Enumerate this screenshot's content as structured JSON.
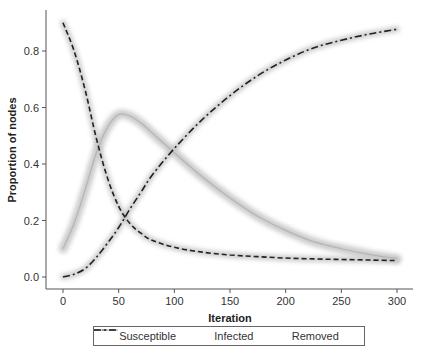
{
  "chart_data": {
    "type": "line",
    "title": "",
    "xlabel": "Iteration",
    "ylabel": "Proportion of nodes",
    "xlim": [
      0,
      300
    ],
    "ylim": [
      0,
      0.9
    ],
    "xticks": [
      0,
      50,
      100,
      150,
      200,
      250,
      300
    ],
    "xtick_labels": [
      "0",
      "50",
      "100",
      "150",
      "200",
      "250",
      "300"
    ],
    "yticks": [
      0.0,
      0.2,
      0.4,
      0.6,
      0.8
    ],
    "ytick_labels": [
      "0.0",
      "0.2",
      "0.4",
      "0.6",
      "0.8"
    ],
    "grid": false,
    "legend_position": "bottom",
    "x": [
      0,
      10,
      20,
      30,
      40,
      50,
      60,
      70,
      80,
      100,
      125,
      150,
      175,
      200,
      225,
      250,
      275,
      300
    ],
    "series": [
      {
        "name": "Susceptible",
        "style": "dashed",
        "color": "#222222",
        "values": [
          0.9,
          0.8,
          0.66,
          0.49,
          0.35,
          0.25,
          0.19,
          0.155,
          0.13,
          0.105,
          0.088,
          0.078,
          0.072,
          0.067,
          0.064,
          0.062,
          0.06,
          0.058
        ]
      },
      {
        "name": "Infected",
        "style": "solid",
        "color": "#b0b0b0",
        "values": [
          0.1,
          0.19,
          0.31,
          0.44,
          0.53,
          0.575,
          0.57,
          0.545,
          0.51,
          0.44,
          0.355,
          0.28,
          0.215,
          0.165,
          0.125,
          0.1,
          0.08,
          0.065
        ]
      },
      {
        "name": "Removed",
        "style": "dashdot",
        "color": "#222222",
        "values": [
          0.0,
          0.01,
          0.03,
          0.07,
          0.12,
          0.175,
          0.24,
          0.3,
          0.36,
          0.455,
          0.557,
          0.642,
          0.713,
          0.768,
          0.811,
          0.838,
          0.86,
          0.877
        ]
      }
    ]
  },
  "legend": {
    "items": [
      {
        "label": "Susceptible"
      },
      {
        "label": "Infected"
      },
      {
        "label": "Removed"
      }
    ]
  }
}
